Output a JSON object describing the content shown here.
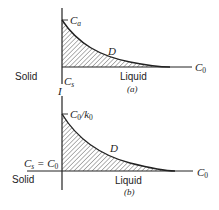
{
  "diagram": {
    "panel_a": {
      "caption": "(a)",
      "solid_label": "Solid",
      "liquid_label": "Liquid",
      "interface_label": "I",
      "top_label": {
        "main": "C",
        "sub": "a"
      },
      "interface_conc_label": {
        "main": "C",
        "sub": "s"
      },
      "far_field_label": {
        "main": "C",
        "sub": "0"
      },
      "curve_label": "D"
    },
    "panel_b": {
      "caption": "(b)",
      "solid_label": "Solid",
      "liquid_label": "Liquid",
      "top_label": {
        "main": "C",
        "sub": "0",
        "slash": "/",
        "main2": "k",
        "sub2": "0"
      },
      "interface_conc_label": {
        "main": "C",
        "sub": "s",
        "eq": " = ",
        "main2": "C",
        "sub2": "0"
      },
      "far_field_label": {
        "main": "C",
        "sub": "0"
      },
      "curve_label": "D"
    },
    "colors": {
      "line": "#222222",
      "hatch": "#444444",
      "background": "#ffffff"
    }
  }
}
